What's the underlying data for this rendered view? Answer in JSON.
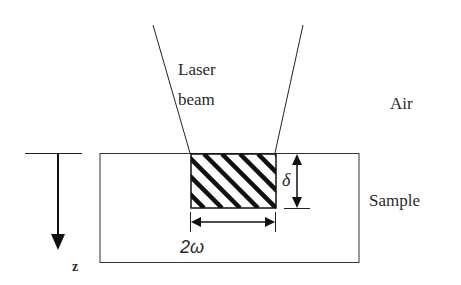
{
  "diagram": {
    "labels": {
      "laser_beam": "Laser\nbeam",
      "laser_beam_line1": "Laser",
      "laser_beam_line2": "beam",
      "air": "Air",
      "sample": "Sample",
      "depth_axis": "z",
      "penetration_depth": "δ",
      "beam_width": "2ω"
    },
    "elements": {
      "laser_beam_cone": {
        "top_left": [
          153,
          25
        ],
        "top_right": [
          303,
          25
        ],
        "bottom_left": [
          190,
          153
        ],
        "bottom_right": [
          275,
          153
        ]
      },
      "sample_block": {
        "x": 100,
        "y": 153,
        "width": 259,
        "height": 109
      },
      "heated_zone_hatched": {
        "x": 190,
        "y": 154,
        "width": 86,
        "height": 54
      },
      "z_axis_arrow": {
        "x": 58,
        "y_start": 153,
        "y_end": 250
      },
      "delta_dimension_arrow": {
        "x": 297,
        "y_start": 154,
        "y_end": 208
      },
      "width_dimension_arrow": {
        "y": 222,
        "x_start": 190,
        "x_end": 275
      }
    },
    "colors": {
      "line": "#222222",
      "background": "#ffffff"
    }
  }
}
